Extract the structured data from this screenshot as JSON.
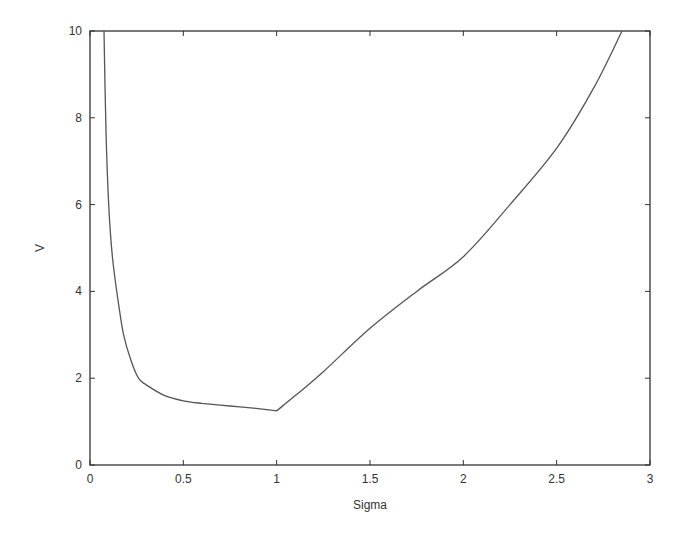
{
  "chart_data": {
    "type": "line",
    "title": "",
    "xlabel": "Sigma",
    "ylabel": "V",
    "xlim": [
      0,
      3
    ],
    "ylim": [
      0,
      10
    ],
    "grid": false,
    "legend": null,
    "xticks": [
      0,
      0.5,
      1,
      1.5,
      2,
      2.5,
      3
    ],
    "xtick_labels": [
      "0",
      "0.5",
      "1",
      "1.5",
      "2",
      "2.5",
      "3"
    ],
    "yticks": [
      0,
      2,
      4,
      6,
      8,
      10
    ],
    "ytick_labels": [
      "0",
      "2",
      "4",
      "6",
      "8",
      "10"
    ],
    "series": [
      {
        "name": "V(Sigma)",
        "color": "#555555",
        "x": [
          0.075,
          0.085,
          0.1,
          0.12,
          0.15,
          0.18,
          0.22,
          0.26,
          0.3,
          0.4,
          0.5,
          0.6,
          0.75,
          0.9,
          1.0,
          1.1,
          1.25,
          1.5,
          1.75,
          2.0,
          2.25,
          2.5,
          2.7,
          2.85
        ],
        "y": [
          10,
          7.8,
          6.0,
          4.8,
          3.8,
          3.0,
          2.4,
          2.0,
          1.85,
          1.6,
          1.48,
          1.42,
          1.36,
          1.3,
          1.25,
          1.6,
          2.15,
          3.15,
          4.0,
          4.8,
          6.0,
          7.3,
          8.7,
          10
        ]
      }
    ]
  }
}
